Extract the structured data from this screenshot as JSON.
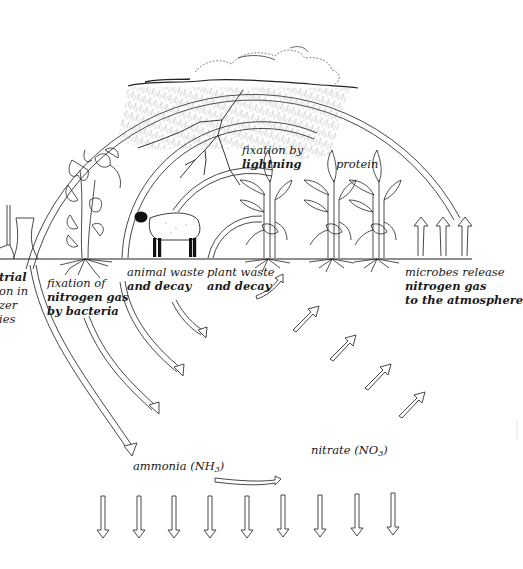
{
  "diagram": {
    "type": "cycle",
    "colors": {
      "ink": "#1a1a1a",
      "background": "#ffffff",
      "rain": "#888888"
    }
  },
  "labels": {
    "industrial": {
      "lines": [
        "trial",
        "on in",
        "zer",
        "ies"
      ]
    },
    "bacteria": {
      "line1": "fixation of",
      "line2": "nitrogen gas",
      "line3": "by bacteria"
    },
    "animal": {
      "line1": "animal waste",
      "line2": "and decay"
    },
    "plant": {
      "line1": "plant waste",
      "line2": "and decay"
    },
    "lightning": {
      "line1": "fixation by",
      "line2": "lightning"
    },
    "protein": {
      "text": "protein"
    },
    "microbes": {
      "line1": "microbes release",
      "line2": "nitrogen gas",
      "line3": "to the atmosphere"
    },
    "ammonia": {
      "text": "ammonia (NH",
      "sub": "3",
      "close": ")"
    },
    "nitrate": {
      "text": "nitrate (NO",
      "sub": "3",
      "close": ")"
    }
  },
  "illustrations": {
    "clouds": "storm-cloud-with-rain",
    "lightning": "lightning-bolt",
    "factory": "industrial-cooling-tower",
    "legume": "legume-plant-with-roots",
    "sheep": "sheep",
    "crops": [
      "corn-plant",
      "corn-plant",
      "corn-plant"
    ]
  },
  "arrows": {
    "down_count": 9,
    "nitrate_up_count": 5,
    "atmosphere_up_count": 3
  }
}
